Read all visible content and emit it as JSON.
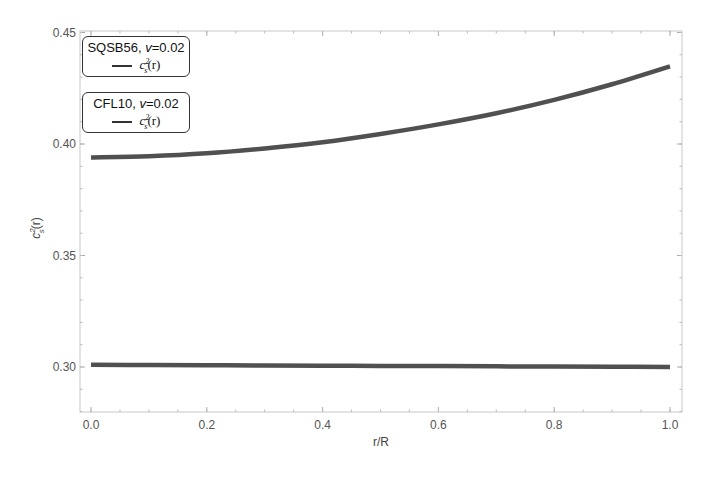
{
  "chart_data": {
    "type": "line",
    "title": "",
    "xlabel": "r/R",
    "ylabel": "c_s^2(r)",
    "xlim": [
      0.0,
      1.0
    ],
    "ylim": [
      0.28,
      0.451
    ],
    "grid": false,
    "x_ticks": [
      "0.0",
      "0.2",
      "0.4",
      "0.6",
      "0.8",
      "1.0"
    ],
    "x_tick_values": [
      0.0,
      0.2,
      0.4,
      0.6,
      0.8,
      1.0
    ],
    "y_ticks": [
      "0.30",
      "0.35",
      "0.40",
      "0.45"
    ],
    "y_tick_values": [
      0.3,
      0.35,
      0.4,
      0.45
    ],
    "x": [
      0.0,
      0.1,
      0.2,
      0.3,
      0.4,
      0.5,
      0.6,
      0.7,
      0.8,
      0.9,
      1.0
    ],
    "series": [
      {
        "name": "SQSB56, v=0.02 — c_s^2(r)",
        "color": "#505050",
        "values": [
          0.394,
          0.3945,
          0.3958,
          0.398,
          0.4008,
          0.4045,
          0.4088,
          0.4138,
          0.4198,
          0.4268,
          0.4348
        ]
      },
      {
        "name": "CFL10, v=0.02 — c_s^2(r)",
        "color": "#505050",
        "values": [
          0.301,
          0.3009,
          0.3008,
          0.3007,
          0.3006,
          0.3005,
          0.3004,
          0.3003,
          0.3002,
          0.3001,
          0.3
        ]
      }
    ],
    "legend": [
      {
        "title_prefix": "SQSB56, ",
        "title_var": "v",
        "title_suffix": "=0.02",
        "entry_base": "c",
        "entry_sup": "2",
        "entry_sub": "s",
        "entry_arg": "(r)"
      },
      {
        "title_prefix": "CFL10, ",
        "title_var": "v",
        "title_suffix": "=0.02",
        "entry_base": "c",
        "entry_sup": "2",
        "entry_sub": "s",
        "entry_arg": "(r)"
      }
    ],
    "legend_position": "top-left"
  }
}
